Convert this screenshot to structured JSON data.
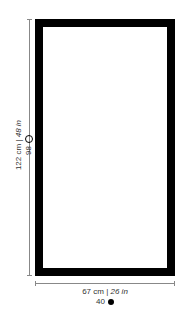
{
  "diagram": {
    "height_dimension": {
      "cm": "122 cm",
      "separator": "|",
      "in": "48 in",
      "number": "98",
      "marker": "ring-icon"
    },
    "width_dimension": {
      "cm": "67 cm",
      "separator": "|",
      "in": "26 in",
      "number": "40",
      "marker": "dot-icon"
    },
    "frame_color": "#000000",
    "line_color": "#888888"
  }
}
